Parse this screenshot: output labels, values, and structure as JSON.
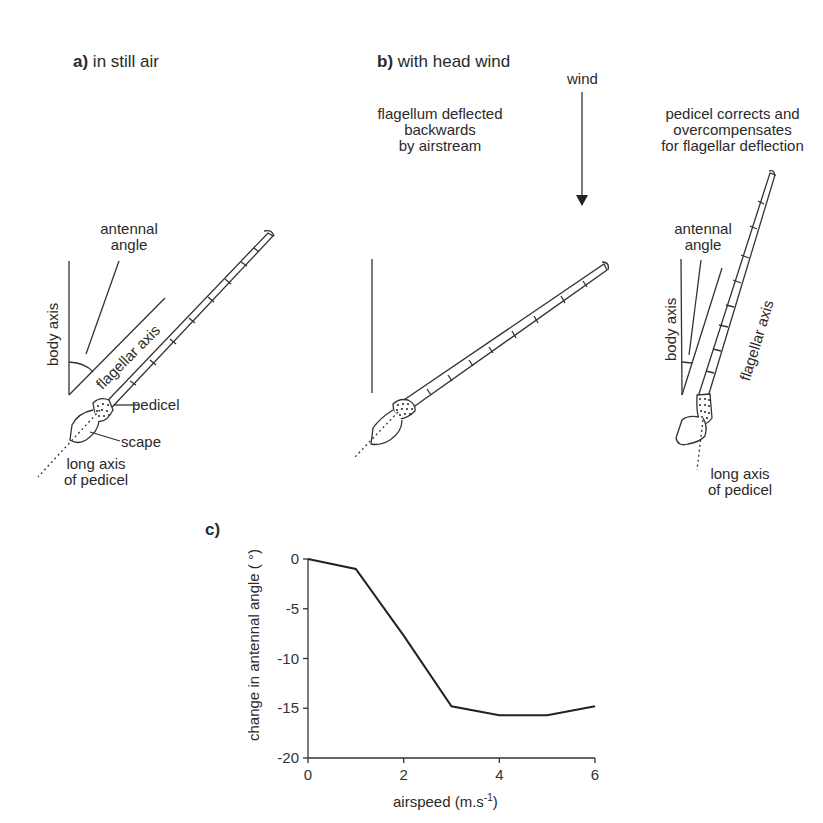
{
  "panel_a": {
    "letter": "a)",
    "title": "in still air",
    "labels": {
      "antennal_angle": [
        "antennal",
        "angle"
      ],
      "body_axis": "body axis",
      "flagellar_axis": "flagellar axis",
      "pedicel": "pedicel",
      "scape": "scape",
      "long_axis": [
        "long axis",
        "of pedicel"
      ]
    }
  },
  "panel_b": {
    "letter": "b)",
    "title": "with head wind",
    "wind_label": "wind",
    "left_caption": [
      "flagellum deflected",
      "backwards",
      "by airstream"
    ],
    "right_caption": [
      "pedicel corrects and",
      "overcompensates",
      "for flagellar deflection"
    ],
    "labels": {
      "antennal_angle": [
        "antennal",
        "angle"
      ],
      "body_axis": "body axis",
      "flagellar_axis": "flagellar axis",
      "long_axis": [
        "long axis",
        "of pedicel"
      ]
    }
  },
  "panel_c": {
    "letter": "c)"
  },
  "chart_data": {
    "type": "line",
    "title": "",
    "xlabel": "airspeed (m.s-1)",
    "xlabel_base": "airspeed (m.s",
    "xlabel_sup": "-1",
    "xlabel_end": ")",
    "ylabel": "change in antennal angle ( o)",
    "ylabel_text": "change in antennal angle ( °)",
    "x": [
      0,
      1,
      2,
      3,
      4,
      5,
      6
    ],
    "series": [
      {
        "name": "antennal angle change",
        "values": [
          0,
          -1,
          -7.7,
          -14.8,
          -15.7,
          -15.7,
          -14.8
        ]
      }
    ],
    "xlim": [
      0,
      6
    ],
    "ylim": [
      -20,
      0
    ],
    "xticks": [
      "0",
      "2",
      "4",
      "6"
    ],
    "yticks": [
      "0",
      "-5",
      "-10",
      "-15",
      "-20"
    ],
    "grid": false,
    "legend": "none"
  }
}
